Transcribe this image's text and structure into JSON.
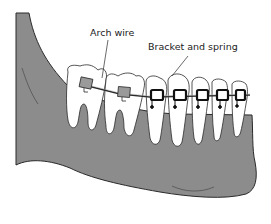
{
  "diagram": {
    "labels": {
      "arch_wire": "Arch wire",
      "bracket_and_spring": "Bracket and spring"
    },
    "colors": {
      "gum": "#8c8c8c",
      "outline": "#2a2a2a",
      "tooth": "#ffffff",
      "bracket_gray": "#9a9a9a",
      "bracket_black": "#111111",
      "background": "#ffffff"
    }
  }
}
